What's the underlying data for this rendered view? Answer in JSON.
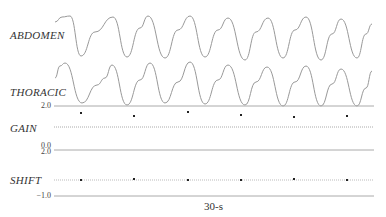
{
  "chart_data": {
    "type": "line",
    "title": "",
    "x_scale_label": "30-s",
    "series": [
      {
        "name": "ABDOMEN",
        "color": "#999999",
        "points": [
          [
            55,
            22
          ],
          [
            62,
            17
          ],
          [
            70,
            16
          ],
          [
            81,
            56
          ],
          [
            95,
            32
          ],
          [
            113,
            17
          ],
          [
            127,
            57
          ],
          [
            140,
            28
          ],
          [
            148,
            16
          ],
          [
            165,
            58
          ],
          [
            178,
            30
          ],
          [
            190,
            16
          ],
          [
            205,
            57
          ],
          [
            218,
            30
          ],
          [
            228,
            18
          ],
          [
            245,
            60
          ],
          [
            256,
            32
          ],
          [
            268,
            18
          ],
          [
            283,
            58
          ],
          [
            295,
            30
          ],
          [
            306,
            17
          ],
          [
            321,
            60
          ],
          [
            332,
            34
          ],
          [
            341,
            19
          ],
          [
            357,
            58
          ],
          [
            366,
            34
          ],
          [
            372,
            24
          ]
        ]
      },
      {
        "name": "THORACIC",
        "color": "#999999",
        "points": [
          [
            55,
            78
          ],
          [
            60,
            66
          ],
          [
            65,
            63
          ],
          [
            82,
            103
          ],
          [
            97,
            85
          ],
          [
            105,
            78
          ],
          [
            112,
            65
          ],
          [
            127,
            105
          ],
          [
            140,
            80
          ],
          [
            150,
            63
          ],
          [
            165,
            103
          ],
          [
            178,
            82
          ],
          [
            190,
            62
          ],
          [
            205,
            104
          ],
          [
            218,
            80
          ],
          [
            228,
            65
          ],
          [
            245,
            105
          ],
          [
            256,
            82
          ],
          [
            267,
            67
          ],
          [
            283,
            106
          ],
          [
            295,
            82
          ],
          [
            306,
            66
          ],
          [
            321,
            106
          ],
          [
            332,
            84
          ],
          [
            341,
            69
          ],
          [
            357,
            106
          ],
          [
            366,
            88
          ],
          [
            372,
            71
          ]
        ]
      },
      {
        "name": "GAIN",
        "type": "scatter",
        "ylim": [
          0.0,
          2.0
        ],
        "baseline_dotted_y": 127,
        "points": [
          [
            81,
            113
          ],
          [
            134,
            116
          ],
          [
            188,
            112
          ],
          [
            241,
            115
          ],
          [
            294,
            117
          ],
          [
            347,
            116
          ]
        ]
      },
      {
        "name": "SHIFT",
        "type": "scatter",
        "ylim": [
          -1.0,
          2.0
        ],
        "baseline_dotted_y": 180,
        "points": [
          [
            81,
            180
          ],
          [
            134,
            179
          ],
          [
            188,
            180
          ],
          [
            241,
            180
          ],
          [
            294,
            179
          ],
          [
            347,
            180
          ]
        ]
      }
    ],
    "tick_labels": {
      "gain_top": "2.0",
      "gain_bottom": "0.0",
      "shift_top": "2.0",
      "shift_bottom": "-1.0"
    },
    "channels": [
      "ABDOMEN",
      "THORACIC",
      "GAIN",
      "SHIFT"
    ],
    "grid": false
  },
  "labels": {
    "abdomen": "ABDOMEN",
    "thoracic": "THORACIC",
    "gain": "GAIN",
    "shift": "SHIFT",
    "tick_2_0_a": "2.0",
    "tick_0_0": "0.0",
    "tick_2_0_b": "2.0",
    "tick_neg_1_0": "−1.0",
    "time_scale": "30-s"
  }
}
